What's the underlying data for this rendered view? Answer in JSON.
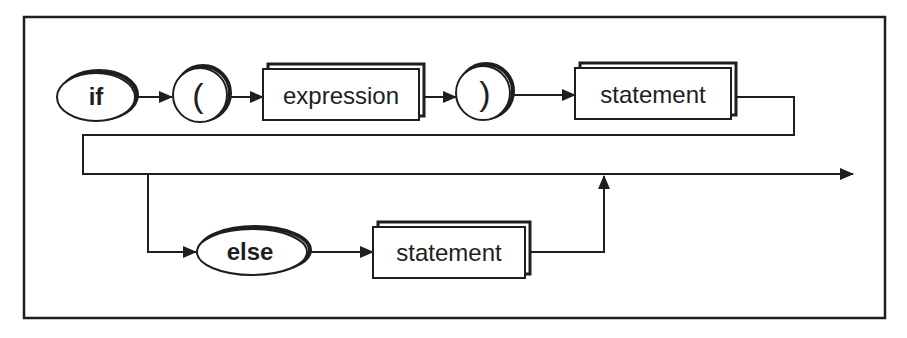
{
  "diagram": {
    "type": "syntax-diagram",
    "colors": {
      "stroke": "#1e1e1e",
      "background": "#ffffff",
      "text": "#1e1e1e"
    },
    "nodes": [
      {
        "id": "if",
        "kind": "keyword-oval",
        "label": "if"
      },
      {
        "id": "lparen",
        "kind": "symbol-circle",
        "label": "("
      },
      {
        "id": "expression",
        "kind": "nonterminal-box",
        "label": "expression"
      },
      {
        "id": "rparen",
        "kind": "symbol-circle",
        "label": ")"
      },
      {
        "id": "statement1",
        "kind": "nonterminal-box",
        "label": "statement"
      },
      {
        "id": "else",
        "kind": "keyword-oval",
        "label": "else"
      },
      {
        "id": "statement2",
        "kind": "nonterminal-box",
        "label": "statement"
      }
    ],
    "edges": [
      {
        "from": "if",
        "to": "lparen"
      },
      {
        "from": "lparen",
        "to": "expression"
      },
      {
        "from": "expression",
        "to": "rparen"
      },
      {
        "from": "rparen",
        "to": "statement1"
      },
      {
        "from": "statement1",
        "to": "exit"
      },
      {
        "from": "statement1",
        "to": "else",
        "note": "optional branch"
      },
      {
        "from": "else",
        "to": "statement2"
      },
      {
        "from": "statement2",
        "to": "exit"
      }
    ],
    "labels": {
      "if": "if",
      "lparen": "(",
      "expression": "expression",
      "rparen": ")",
      "statement1": "statement",
      "else": "else",
      "statement2": "statement"
    }
  }
}
